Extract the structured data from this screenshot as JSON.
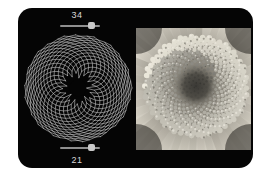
{
  "app": {
    "title": "Phyllotaxis Spiral Viewer",
    "panel_background": "#050505",
    "page_background": "#ffffff"
  },
  "controls": {
    "top_slider": {
      "name": "clockwise-parastichy-slider",
      "value": "34",
      "value_number": 34,
      "min": 1,
      "max": 40,
      "fill_ratio": 0.86
    },
    "bottom_slider": {
      "name": "counterclockwise-parastichy-slider",
      "value": "21",
      "value_number": 21,
      "min": 1,
      "max": 25,
      "fill_ratio": 0.86
    },
    "track_color": "#8f8f8f",
    "thumb_color": "#c9c9c9",
    "label_color": "#d8d8d8"
  },
  "spiral": {
    "name": "phyllotaxis-spiral-diagram",
    "arms_clockwise": 34,
    "arms_counterclockwise": 21,
    "points_per_arm": 17,
    "divergence_angle_deg": 137.5,
    "center_x": 56,
    "center_y": 58,
    "inner_radius": 7.5,
    "outer_radius": 54,
    "core_radius": 8.5,
    "line_color": "#e6e6e6",
    "line_width": 0.55,
    "background": "#050505"
  },
  "photo": {
    "name": "sunflower-macro-photograph",
    "subject": "flower head disc florets showing phyllotaxis",
    "palette": "grayscale",
    "floret_count": 520,
    "divergence_angle_deg": 137.5,
    "center_x": 60,
    "center_y": 58,
    "disc_radius": 52,
    "core_radius": 15,
    "core_color": "#3b3a36",
    "mid_color": "#b9b4a8",
    "rim_color": "#e8e4da",
    "petal_color": "#cfcabd",
    "background": "#1a1a1a"
  }
}
